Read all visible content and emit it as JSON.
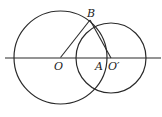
{
  "diagram": {
    "stroke_color": "#2a2a2a",
    "line": {
      "x1": 5,
      "y1": 58,
      "x2": 161,
      "y2": 58
    },
    "circle_O": {
      "cx": 60.5,
      "cy": 57.5,
      "r": 46.5
    },
    "circle_O_prime": {
      "cx": 111,
      "cy": 58,
      "r": 35
    },
    "segment_OB": {
      "x1": 60.5,
      "y1": 57.5,
      "x2": 90,
      "y2": 20
    },
    "segment_BO_prime": {
      "x1": 90,
      "y1": 20,
      "x2": 111,
      "y2": 58
    },
    "labels": {
      "B": "B",
      "O": "O",
      "A": "A",
      "O_prime": "O′"
    }
  }
}
